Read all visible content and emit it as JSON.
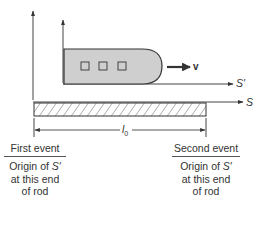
{
  "diagram": {
    "frames": {
      "stationary": {
        "label": "S"
      },
      "moving": {
        "label": "S′"
      }
    },
    "velocity_label": "v",
    "length_label_base": "l",
    "length_label_sub": "0",
    "rod": {
      "label": "rod",
      "fill": "hatched"
    },
    "ship": {
      "windows": 3,
      "fill": "#cfcfcf"
    },
    "events": [
      {
        "title": "First event",
        "line1_pre": "Origin of ",
        "line1_frame": "S′",
        "line2": "at this end",
        "line3": "of rod"
      },
      {
        "title": "Second event",
        "line1_pre": "Origin of ",
        "line1_frame": "S′",
        "line2": "at this end",
        "line3": "of rod"
      }
    ]
  }
}
